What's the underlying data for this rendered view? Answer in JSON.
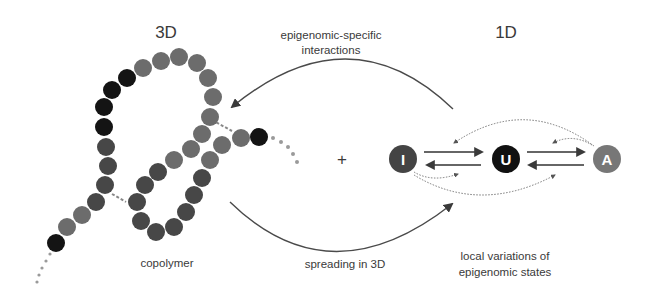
{
  "titles": {
    "left": "3D",
    "right": "1D"
  },
  "labels": {
    "top_arrow_line1": "epigenomic-specific",
    "top_arrow_line2": "interactions",
    "bottom_arrow": "spreading in 3D",
    "copolymer": "copolymer",
    "plus": "+",
    "right_caption_line1": "local variations of",
    "right_caption_line2": "epigenomic states"
  },
  "states": [
    {
      "letter": "I",
      "name": "inactive",
      "color": "#444444"
    },
    {
      "letter": "U",
      "name": "unmarked",
      "color": "#111111"
    },
    {
      "letter": "A",
      "name": "active",
      "color": "#777777"
    }
  ],
  "colors": {
    "bead_black": "#141414",
    "bead_gray": "#6c6c6c",
    "bead_dark": "#474747",
    "arrow": "#4a4a4a",
    "dots": "#9a9a9a"
  }
}
